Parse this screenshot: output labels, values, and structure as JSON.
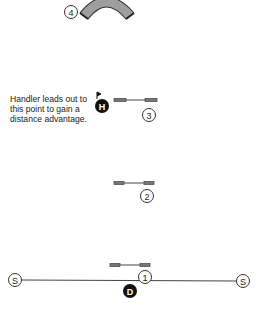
{
  "annotation": {
    "lines": [
      "Handler leads out to",
      "this point to gain a",
      "distance advantage."
    ]
  },
  "obstacles": {
    "tunnel": {
      "number": "4"
    },
    "jump3": {
      "number": "3"
    },
    "jump2": {
      "number": "2"
    },
    "jump1": {
      "number": "1"
    }
  },
  "markers": {
    "handler": {
      "label": "H"
    },
    "dog": {
      "label": "D"
    },
    "start_left": {
      "label": "S"
    },
    "start_right": {
      "label": "S"
    }
  },
  "colors": {
    "tunnel_fill": "#9e9e9e",
    "tunnel_outline": "#333333",
    "bar_fill": "#777777",
    "line": "#444444",
    "marker_fill": "#111111"
  }
}
